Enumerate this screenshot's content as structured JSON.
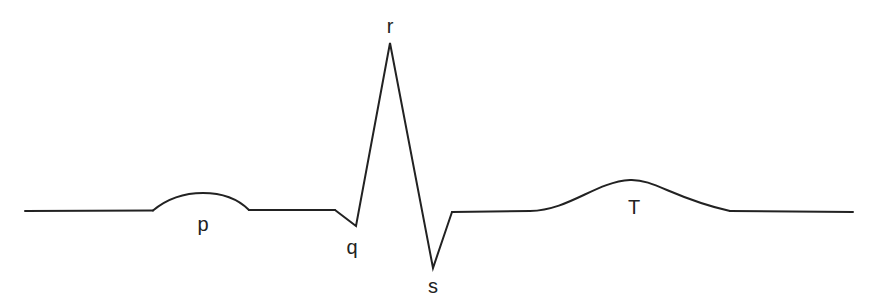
{
  "diagram": {
    "type": "ecg-waveform",
    "colors": {
      "background": "#ffffff",
      "trace": "#222222"
    },
    "labels": {
      "p": "p",
      "q": "q",
      "r": "r",
      "s": "s",
      "t": "T"
    }
  }
}
